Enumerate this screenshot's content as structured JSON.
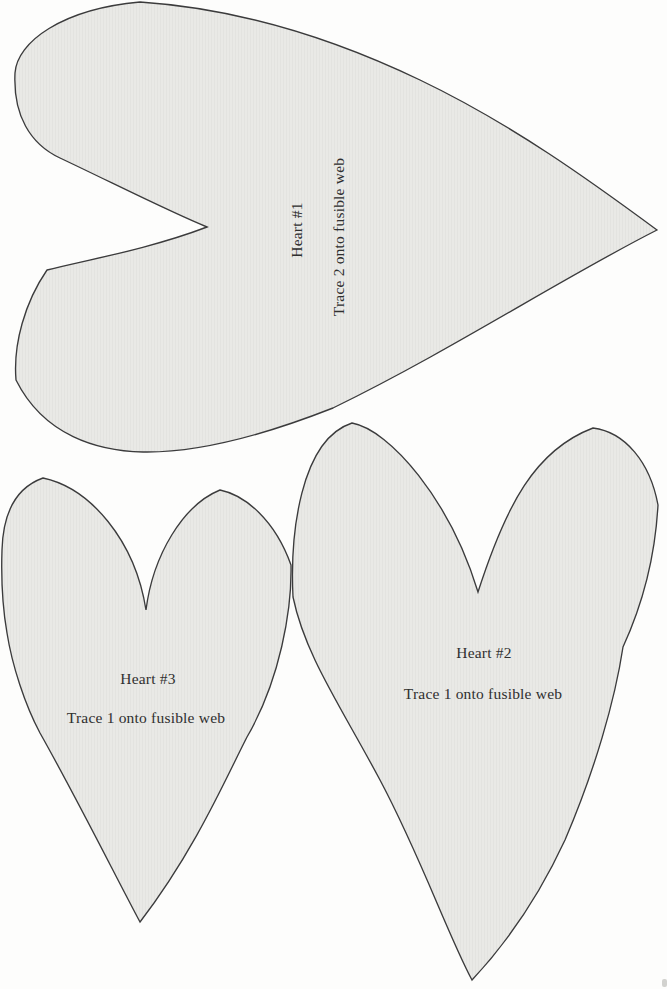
{
  "document": {
    "kind": "applique pattern sheet",
    "background": "#fdfdfc"
  },
  "colors": {
    "heart_fill": "#e9e9e6",
    "heart_texture_line": "#e3e3e0",
    "heart_outline": "#3b3b3c",
    "text": "#2f2f2f",
    "artifact": "#d2d2cf"
  },
  "templates": [
    {
      "name": "Heart #1",
      "instruction": "Trace 2 onto fusible web",
      "orientation": "point facing right, label rotated 90° counterclockwise"
    },
    {
      "name": "Heart #2",
      "instruction": "Trace 1 onto fusible web",
      "orientation": "point facing down"
    },
    {
      "name": "Heart #3",
      "instruction": "Trace 1 onto fusible web",
      "orientation": "point facing down"
    }
  ]
}
